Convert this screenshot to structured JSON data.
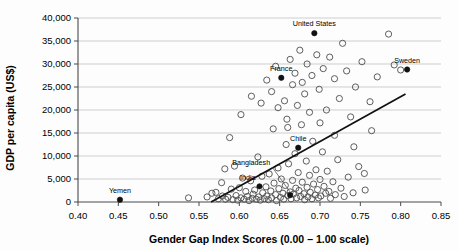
{
  "chart_data": {
    "type": "scatter",
    "title": "",
    "xlabel": "Gender Gap Index Scores (0.00 – 1.00 scale)",
    "ylabel": "GDP per capita (US$)",
    "xlim": [
      0.4,
      0.85
    ],
    "ylim": [
      0,
      40000
    ],
    "xticks": [
      0.4,
      0.45,
      0.5,
      0.55,
      0.6,
      0.65,
      0.7,
      0.75,
      0.8,
      0.85
    ],
    "xtick_labels": [
      "0.40",
      "0.45",
      "0.50",
      "0.55",
      "0.60",
      "0.65",
      "0.70",
      "0.75",
      "0.80",
      "0.85"
    ],
    "yticks": [
      0,
      5000,
      10000,
      15000,
      20000,
      25000,
      30000,
      35000,
      40000
    ],
    "ytick_labels": [
      "0",
      "5,000",
      "10,000",
      "15,000",
      "20,000",
      "25,000",
      "30,000",
      "35,000",
      "40,000"
    ],
    "grid": "horizontal",
    "legend": "none",
    "trendline": {
      "x0": 0.565,
      "y0": 0,
      "x1": 0.806,
      "y1": 23500
    },
    "highlighted_points": [
      {
        "label": "Yemen",
        "x": 0.452,
        "y": 500,
        "label_dx": 0,
        "label_dy": -7,
        "anchor": "middle",
        "leader": false
      },
      {
        "label": "India",
        "x": 0.625,
        "y": 3400,
        "label_dx": -4,
        "label_dy": -6,
        "anchor": "end",
        "leader": false
      },
      {
        "label": "Bangladesh",
        "x": 0.663,
        "y": 1500,
        "label_dx": -20,
        "label_dy": -30,
        "anchor": "end",
        "leader": true
      },
      {
        "label": "Chile",
        "x": 0.673,
        "y": 11800,
        "label_dx": 0,
        "label_dy": -7,
        "anchor": "middle",
        "leader": false
      },
      {
        "label": "France",
        "x": 0.652,
        "y": 27000,
        "label_dx": 0,
        "label_dy": -7,
        "anchor": "middle",
        "leader": false
      },
      {
        "label": "United States",
        "x": 0.693,
        "y": 36700,
        "label_dx": 0,
        "label_dy": -7,
        "anchor": "middle",
        "leader": false
      },
      {
        "label": "Sweden",
        "x": 0.808,
        "y": 28800,
        "label_dx": 0,
        "label_dy": -7,
        "anchor": "middle",
        "leader": false
      }
    ],
    "points": [
      {
        "x": 0.537,
        "y": 900
      },
      {
        "x": 0.56,
        "y": 1100
      },
      {
        "x": 0.566,
        "y": 1900
      },
      {
        "x": 0.571,
        "y": 2100
      },
      {
        "x": 0.574,
        "y": 700
      },
      {
        "x": 0.578,
        "y": 4200
      },
      {
        "x": 0.579,
        "y": 1300
      },
      {
        "x": 0.582,
        "y": 7200
      },
      {
        "x": 0.583,
        "y": 600
      },
      {
        "x": 0.586,
        "y": 1000
      },
      {
        "x": 0.588,
        "y": 14000
      },
      {
        "x": 0.59,
        "y": 2800
      },
      {
        "x": 0.592,
        "y": 500
      },
      {
        "x": 0.594,
        "y": 7800
      },
      {
        "x": 0.596,
        "y": 1400
      },
      {
        "x": 0.598,
        "y": 400
      },
      {
        "x": 0.6,
        "y": 3100
      },
      {
        "x": 0.602,
        "y": 900
      },
      {
        "x": 0.604,
        "y": 5200
      },
      {
        "x": 0.606,
        "y": 600
      },
      {
        "x": 0.608,
        "y": 2300
      },
      {
        "x": 0.61,
        "y": 1200
      },
      {
        "x": 0.612,
        "y": 300
      },
      {
        "x": 0.614,
        "y": 4600
      },
      {
        "x": 0.616,
        "y": 800
      },
      {
        "x": 0.617,
        "y": 1700
      },
      {
        "x": 0.619,
        "y": 2600
      },
      {
        "x": 0.621,
        "y": 600
      },
      {
        "x": 0.623,
        "y": 9800
      },
      {
        "x": 0.624,
        "y": 1100
      },
      {
        "x": 0.626,
        "y": 400
      },
      {
        "x": 0.628,
        "y": 5600
      },
      {
        "x": 0.629,
        "y": 2000
      },
      {
        "x": 0.631,
        "y": 700
      },
      {
        "x": 0.633,
        "y": 3300
      },
      {
        "x": 0.634,
        "y": 1300
      },
      {
        "x": 0.636,
        "y": 500
      },
      {
        "x": 0.637,
        "y": 6100
      },
      {
        "x": 0.639,
        "y": 2400
      },
      {
        "x": 0.64,
        "y": 900
      },
      {
        "x": 0.642,
        "y": 15900
      },
      {
        "x": 0.643,
        "y": 4100
      },
      {
        "x": 0.645,
        "y": 1600
      },
      {
        "x": 0.646,
        "y": 300
      },
      {
        "x": 0.648,
        "y": 7400
      },
      {
        "x": 0.649,
        "y": 2900
      },
      {
        "x": 0.651,
        "y": 1000
      },
      {
        "x": 0.652,
        "y": 5000
      },
      {
        "x": 0.654,
        "y": 1900
      },
      {
        "x": 0.655,
        "y": 600
      },
      {
        "x": 0.657,
        "y": 3600
      },
      {
        "x": 0.658,
        "y": 12500
      },
      {
        "x": 0.66,
        "y": 1400
      },
      {
        "x": 0.661,
        "y": 8300
      },
      {
        "x": 0.663,
        "y": 2200
      },
      {
        "x": 0.664,
        "y": 700
      },
      {
        "x": 0.666,
        "y": 4700
      },
      {
        "x": 0.667,
        "y": 1700
      },
      {
        "x": 0.669,
        "y": 10500
      },
      {
        "x": 0.67,
        "y": 3000
      },
      {
        "x": 0.671,
        "y": 900
      },
      {
        "x": 0.673,
        "y": 6400
      },
      {
        "x": 0.674,
        "y": 2500
      },
      {
        "x": 0.676,
        "y": 1200
      },
      {
        "x": 0.677,
        "y": 16800
      },
      {
        "x": 0.678,
        "y": 4300
      },
      {
        "x": 0.68,
        "y": 1800
      },
      {
        "x": 0.681,
        "y": 500
      },
      {
        "x": 0.683,
        "y": 8900
      },
      {
        "x": 0.684,
        "y": 3200
      },
      {
        "x": 0.685,
        "y": 1100
      },
      {
        "x": 0.687,
        "y": 5800
      },
      {
        "x": 0.688,
        "y": 2100
      },
      {
        "x": 0.69,
        "y": 700
      },
      {
        "x": 0.691,
        "y": 13200
      },
      {
        "x": 0.692,
        "y": 3900
      },
      {
        "x": 0.694,
        "y": 1500
      },
      {
        "x": 0.695,
        "y": 7000
      },
      {
        "x": 0.697,
        "y": 2700
      },
      {
        "x": 0.698,
        "y": 900
      },
      {
        "x": 0.7,
        "y": 4900
      },
      {
        "x": 0.701,
        "y": 1300
      },
      {
        "x": 0.703,
        "y": 10900
      },
      {
        "x": 0.705,
        "y": 3400
      },
      {
        "x": 0.707,
        "y": 1900
      },
      {
        "x": 0.709,
        "y": 6700
      },
      {
        "x": 0.711,
        "y": 2300
      },
      {
        "x": 0.713,
        "y": 800
      },
      {
        "x": 0.716,
        "y": 4400
      },
      {
        "x": 0.719,
        "y": 1600
      },
      {
        "x": 0.722,
        "y": 9200
      },
      {
        "x": 0.726,
        "y": 3000
      },
      {
        "x": 0.73,
        "y": 1200
      },
      {
        "x": 0.735,
        "y": 5400
      },
      {
        "x": 0.741,
        "y": 2000
      },
      {
        "x": 0.748,
        "y": 7700
      },
      {
        "x": 0.756,
        "y": 2600
      },
      {
        "x": 0.602,
        "y": 19000
      },
      {
        "x": 0.615,
        "y": 23000
      },
      {
        "x": 0.627,
        "y": 21500
      },
      {
        "x": 0.634,
        "y": 26500
      },
      {
        "x": 0.64,
        "y": 24000
      },
      {
        "x": 0.645,
        "y": 29500
      },
      {
        "x": 0.648,
        "y": 20500
      },
      {
        "x": 0.656,
        "y": 22000
      },
      {
        "x": 0.659,
        "y": 18000
      },
      {
        "x": 0.663,
        "y": 31000
      },
      {
        "x": 0.666,
        "y": 25500
      },
      {
        "x": 0.669,
        "y": 28000
      },
      {
        "x": 0.672,
        "y": 21000
      },
      {
        "x": 0.675,
        "y": 33000
      },
      {
        "x": 0.678,
        "y": 26000
      },
      {
        "x": 0.681,
        "y": 23500
      },
      {
        "x": 0.684,
        "y": 30000
      },
      {
        "x": 0.687,
        "y": 19500
      },
      {
        "x": 0.69,
        "y": 27500
      },
      {
        "x": 0.696,
        "y": 32000
      },
      {
        "x": 0.699,
        "y": 24500
      },
      {
        "x": 0.704,
        "y": 29000
      },
      {
        "x": 0.708,
        "y": 20000
      },
      {
        "x": 0.712,
        "y": 31500
      },
      {
        "x": 0.718,
        "y": 26800
      },
      {
        "x": 0.724,
        "y": 22500
      },
      {
        "x": 0.728,
        "y": 34500
      },
      {
        "x": 0.733,
        "y": 28500
      },
      {
        "x": 0.738,
        "y": 18500
      },
      {
        "x": 0.744,
        "y": 25000
      },
      {
        "x": 0.752,
        "y": 30500
      },
      {
        "x": 0.762,
        "y": 21800
      },
      {
        "x": 0.771,
        "y": 27200
      },
      {
        "x": 0.785,
        "y": 36500
      },
      {
        "x": 0.792,
        "y": 29800
      },
      {
        "x": 0.8,
        "y": 28700
      },
      {
        "x": 0.764,
        "y": 15500
      },
      {
        "x": 0.742,
        "y": 12000
      },
      {
        "x": 0.755,
        "y": 6200
      },
      {
        "x": 0.718,
        "y": 14500
      },
      {
        "x": 0.7,
        "y": 17200
      },
      {
        "x": 0.66,
        "y": 16200
      }
    ]
  }
}
